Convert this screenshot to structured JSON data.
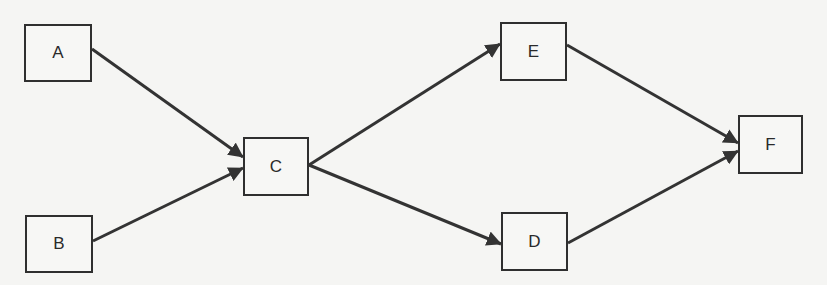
{
  "diagram": {
    "type": "directed-graph",
    "line_color": "#333333",
    "node_border_color": "#2f2f2f",
    "background_color": "#f5f5f3",
    "nodes": [
      {
        "id": "A",
        "label": "A",
        "x": 24,
        "y": 24,
        "w": 68,
        "h": 58
      },
      {
        "id": "B",
        "label": "B",
        "x": 25,
        "y": 215,
        "w": 68,
        "h": 58
      },
      {
        "id": "C",
        "label": "C",
        "x": 243,
        "y": 137,
        "w": 66,
        "h": 59
      },
      {
        "id": "E",
        "label": "E",
        "x": 500,
        "y": 22,
        "w": 67,
        "h": 59
      },
      {
        "id": "D",
        "label": "D",
        "x": 501,
        "y": 212,
        "w": 67,
        "h": 59
      },
      {
        "id": "F",
        "label": "F",
        "x": 738,
        "y": 115,
        "w": 65,
        "h": 59
      }
    ],
    "edges": [
      {
        "from": "A",
        "to": "C",
        "x1": 92,
        "y1": 49,
        "x2": 243,
        "y2": 157
      },
      {
        "from": "B",
        "to": "C",
        "x1": 93,
        "y1": 241,
        "x2": 243,
        "y2": 168
      },
      {
        "from": "C",
        "to": "E",
        "x1": 309,
        "y1": 165,
        "x2": 500,
        "y2": 44
      },
      {
        "from": "C",
        "to": "D",
        "x1": 309,
        "y1": 165,
        "x2": 501,
        "y2": 244
      },
      {
        "from": "E",
        "to": "F",
        "x1": 567,
        "y1": 45,
        "x2": 738,
        "y2": 143
      },
      {
        "from": "D",
        "to": "F",
        "x1": 568,
        "y1": 243,
        "x2": 738,
        "y2": 151
      }
    ]
  }
}
